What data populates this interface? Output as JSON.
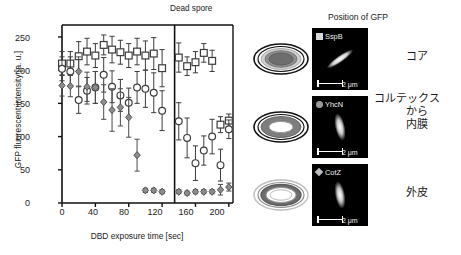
{
  "chart_data": {
    "type": "scatter",
    "title": "",
    "xlabel": "DBD exposure time [sec]",
    "ylabel": "GFP fluorescent intensity [a. u.]",
    "xlim": [
      0,
      205
    ],
    "ylim": [
      0,
      268
    ],
    "xticks": [
      0,
      40,
      80,
      120,
      160,
      200
    ],
    "yticks": [
      0,
      50,
      100,
      150,
      200,
      250
    ],
    "grid": false,
    "legend": "none",
    "annotations": [
      {
        "text": "Dead spore",
        "x": 168,
        "y": 262,
        "divider_x": 135
      }
    ],
    "series": [
      {
        "name": "SspB",
        "marker": "open-square",
        "color": "#ffffff",
        "edge": "#3c3c3c",
        "x": [
          0,
          10,
          20,
          30,
          40,
          50,
          60,
          70,
          80,
          90,
          100,
          110,
          120,
          140,
          150,
          160,
          170,
          180,
          190,
          200
        ],
        "y": [
          210,
          210,
          221,
          228,
          222,
          238,
          231,
          227,
          222,
          228,
          222,
          225,
          203,
          219,
          206,
          212,
          226,
          214,
          118,
          124
        ],
        "yerr": [
          18,
          18,
          22,
          20,
          18,
          15,
          20,
          18,
          18,
          20,
          22,
          24,
          28,
          22,
          14,
          16,
          14,
          16,
          12,
          10
        ]
      },
      {
        "name": "YhcN",
        "marker": "open-circle",
        "color": "#ffffff",
        "edge": "#3c3c3c",
        "x": [
          0,
          10,
          20,
          30,
          40,
          50,
          60,
          70,
          80,
          90,
          100,
          110,
          120,
          140,
          150,
          160,
          170,
          180,
          190,
          200
        ],
        "y": [
          202,
          198,
          155,
          169,
          174,
          193,
          175,
          162,
          151,
          174,
          172,
          166,
          139,
          123,
          98,
          60,
          79,
          100,
          57,
          111
        ],
        "yerr": [
          18,
          22,
          20,
          20,
          24,
          26,
          24,
          24,
          22,
          24,
          28,
          30,
          30,
          28,
          30,
          26,
          22,
          26,
          24,
          14
        ]
      },
      {
        "name": "CotZ",
        "marker": "filled-diamond",
        "color": "#8c8c8c",
        "edge": "#4a4a4a",
        "x": [
          0,
          10,
          20,
          30,
          40,
          50,
          60,
          70,
          80,
          90,
          100,
          110,
          120,
          140,
          150,
          160,
          170,
          180,
          190,
          200
        ],
        "y": [
          177,
          176,
          198,
          175,
          174,
          152,
          140,
          144,
          129,
          72,
          19,
          19,
          17,
          17,
          15,
          17,
          17,
          17,
          20,
          24
        ],
        "yerr": [
          16,
          16,
          22,
          22,
          24,
          26,
          32,
          28,
          30,
          24,
          3,
          3,
          3,
          3,
          3,
          3,
          3,
          3,
          8,
          6
        ]
      }
    ]
  },
  "panel": {
    "title": "Position of GFP",
    "rows": [
      {
        "gene": "SspB",
        "marker": "square",
        "scale": "2 μm",
        "jp": "コア",
        "jp_lines": [
          "コア"
        ],
        "spore": "core-filled"
      },
      {
        "gene": "YhcN",
        "marker": "circle",
        "scale": "2 μm",
        "jp": "コルテックスから内膜",
        "jp_lines": [
          "コルテックス",
          "から",
          "内膜"
        ],
        "spore": "cortex-ring"
      },
      {
        "gene": "CotZ",
        "marker": "diamond",
        "scale": "2 μm",
        "jp": "外皮",
        "jp_lines": [
          "外皮"
        ],
        "spore": "coat-ring"
      }
    ]
  }
}
